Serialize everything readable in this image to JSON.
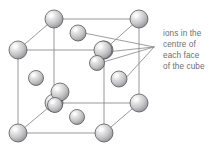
{
  "figure": {
    "background_color": "#ffffff"
  },
  "annotation": {
    "name": "face-centre-ions-callout",
    "lines": [
      "ions in the",
      "centre of",
      "each face",
      "of the cube"
    ],
    "text_color": "#6e6e72",
    "leader_origin": {
      "x": 154,
      "y": 47
    },
    "leader_targets": [
      {
        "x": 84,
        "y": 33,
        "label": "top-face-centre-ion"
      },
      {
        "x": 106,
        "y": 52,
        "label": "back-face-centre-ion"
      },
      {
        "x": 100,
        "y": 63,
        "label": "inner-face-centre-ion"
      },
      {
        "x": 124,
        "y": 80,
        "label": "right-face-centre-ion"
      }
    ]
  },
  "cube": {
    "name": "unit-cell-cube",
    "edge_color": "#8c8c90",
    "edge_width": 0.9,
    "front_face": {
      "top_left": {
        "x": 18,
        "y": 50
      },
      "top_right": {
        "x": 104,
        "y": 50
      },
      "bottom_right": {
        "x": 104,
        "y": 133
      },
      "bottom_left": {
        "x": 18,
        "y": 133
      }
    },
    "back_face": {
      "top_left": {
        "x": 54,
        "y": 19
      },
      "top_right": {
        "x": 139,
        "y": 19
      },
      "bottom_right": {
        "x": 139,
        "y": 103
      },
      "bottom_left": {
        "x": 54,
        "y": 103
      }
    }
  },
  "ions": {
    "sphere_fill_light": "#f2f2f2",
    "sphere_fill_mid": "#c9c9c9",
    "sphere_fill_dark": "#8f8f93",
    "sphere_outline": "#58585c",
    "corner_radius": 9,
    "face_radius": 8,
    "corner_ions": [
      {
        "name": "corner-ion-front-top-left",
        "x": 18,
        "y": 50,
        "r": 9
      },
      {
        "name": "corner-ion-front-top-right",
        "x": 104,
        "y": 50,
        "r": 9
      },
      {
        "name": "corner-ion-front-bottom-left",
        "x": 18,
        "y": 133,
        "r": 9
      },
      {
        "name": "corner-ion-front-bottom-right",
        "x": 104,
        "y": 133,
        "r": 9
      },
      {
        "name": "corner-ion-back-top-left",
        "x": 54,
        "y": 19,
        "r": 9
      },
      {
        "name": "corner-ion-back-top-right",
        "x": 139,
        "y": 19,
        "r": 9
      },
      {
        "name": "corner-ion-back-bottom-left",
        "x": 54,
        "y": 103,
        "r": 9
      },
      {
        "name": "corner-ion-back-bottom-right",
        "x": 139,
        "y": 103,
        "r": 9
      }
    ],
    "face_ions": [
      {
        "name": "face-ion-top",
        "x": 78,
        "y": 33,
        "r": 8
      },
      {
        "name": "face-ion-back",
        "x": 103,
        "y": 50,
        "r": 9
      },
      {
        "name": "face-ion-centre",
        "x": 97,
        "y": 63,
        "r": 7.5
      },
      {
        "name": "face-ion-left",
        "x": 36,
        "y": 78,
        "r": 7.5
      },
      {
        "name": "face-ion-right",
        "x": 119,
        "y": 79,
        "r": 8
      },
      {
        "name": "face-ion-front",
        "x": 60,
        "y": 92,
        "r": 9
      },
      {
        "name": "face-ion-inner",
        "x": 55,
        "y": 105,
        "r": 7.5
      },
      {
        "name": "face-ion-bottom",
        "x": 77,
        "y": 117,
        "r": 7.5
      }
    ]
  }
}
